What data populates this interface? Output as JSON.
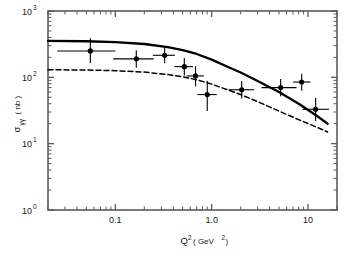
{
  "chart_data": {
    "type": "scatter",
    "title": "",
    "xlabel": "Q² ( GeV² )",
    "xlabel_parts": {
      "base": "Q",
      "exp": "2",
      "unit_open": "( GeV",
      "unit_exp": "2",
      "unit_close": " )"
    },
    "ylabel": "σγγ ( nb )",
    "ylabel_parts": {
      "sigma": "σ",
      "sub": "γγ",
      "unit": "( nb )"
    },
    "xscale": "log",
    "yscale": "log",
    "xlim": [
      0.02,
      20.0
    ],
    "ylim": [
      1.0,
      1000.0
    ],
    "grid": false,
    "legend": "none",
    "xticks": [
      {
        "value": 0.1,
        "label": "0.1"
      },
      {
        "value": 1.0,
        "label": "1.0"
      },
      {
        "value": 10.0,
        "label": "10"
      }
    ],
    "yticks": [
      {
        "value": 1.0,
        "label_base": "10",
        "label_exp": "0"
      },
      {
        "value": 10.0,
        "label_base": "10",
        "label_exp": "1"
      },
      {
        "value": 100.0,
        "label_base": "10",
        "label_exp": "2"
      },
      {
        "value": 1000.0,
        "label_base": "10",
        "label_exp": "3"
      }
    ],
    "points": [
      {
        "x": 0.055,
        "y": 250.0,
        "xerr_low": 0.03,
        "xerr_high": 0.045,
        "yerr_low": 85.0,
        "yerr_high": 140.0
      },
      {
        "x": 0.165,
        "y": 190.0,
        "xerr_low": 0.07,
        "xerr_high": 0.085,
        "yerr_low": 50.0,
        "yerr_high": 65.0
      },
      {
        "x": 0.325,
        "y": 215.0,
        "xerr_low": 0.08,
        "xerr_high": 0.09,
        "yerr_low": 52.0,
        "yerr_high": 68.0
      },
      {
        "x": 0.52,
        "y": 145.0,
        "xerr_low": 0.11,
        "xerr_high": 0.12,
        "yerr_low": 38.0,
        "yerr_high": 50.0
      },
      {
        "x": 0.68,
        "y": 105.0,
        "xerr_low": 0.13,
        "xerr_high": 0.15,
        "yerr_low": 32.0,
        "yerr_high": 42.0
      },
      {
        "x": 0.9,
        "y": 55.0,
        "xerr_low": 0.19,
        "xerr_high": 0.23,
        "yerr_low": 24.0,
        "yerr_high": 34.0
      },
      {
        "x": 2.05,
        "y": 65.0,
        "xerr_low": 0.55,
        "xerr_high": 0.7,
        "yerr_low": 17.0,
        "yerr_high": 23.0
      },
      {
        "x": 5.2,
        "y": 70.0,
        "xerr_low": 1.9,
        "xerr_high": 2.4,
        "yerr_low": 18.0,
        "yerr_high": 24.0
      },
      {
        "x": 8.6,
        "y": 85.0,
        "xerr_low": 1.6,
        "xerr_high": 2.0,
        "yerr_low": 22.0,
        "yerr_high": 28.0
      },
      {
        "x": 12.0,
        "y": 33.0,
        "xerr_low": 3.2,
        "xerr_high": 4.5,
        "yerr_low": 11.0,
        "yerr_high": 16.0
      }
    ],
    "curves": [
      {
        "name": "solid-curve",
        "style": "solid",
        "color": "#000000",
        "x": [
          0.02,
          0.05,
          0.1,
          0.2,
          0.35,
          0.5,
          0.7,
          1.0,
          1.5,
          2.0,
          3.0,
          5.0,
          8.0,
          12.0,
          16.0
        ],
        "y": [
          355.0,
          350.0,
          340.0,
          318.0,
          285.0,
          258.0,
          225.0,
          185.0,
          142.0,
          118.0,
          88.0,
          60.0,
          40.0,
          27.0,
          20.0
        ]
      },
      {
        "name": "dashed-curve",
        "style": "dashed",
        "color": "#000000",
        "x": [
          0.02,
          0.05,
          0.1,
          0.2,
          0.35,
          0.5,
          0.7,
          1.0,
          1.5,
          2.0,
          3.0,
          5.0,
          8.0,
          12.0,
          16.0
        ],
        "y": [
          130.0,
          129.0,
          126.0,
          120.0,
          110.0,
          102.0,
          92.0,
          79.0,
          64.0,
          55.0,
          43.0,
          31.0,
          23.0,
          18.0,
          15.0
        ]
      }
    ]
  },
  "figure": {
    "background": "#ffffff",
    "frame_color": "#5a5a5a",
    "marker_color": "#000000",
    "marker_shape": "filled-circle"
  }
}
